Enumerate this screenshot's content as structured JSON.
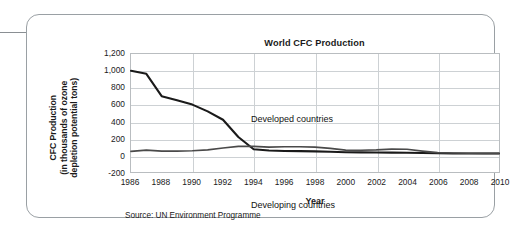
{
  "panel": {
    "connector": "leader-line"
  },
  "chart_data": {
    "type": "line",
    "title": "World CFC Production",
    "xlabel": "Year",
    "ylabel": "CFC Production (in thousands of ozone depletion potential tons)",
    "ylabel_line1": "CFC Production",
    "ylabel_line2": "(in thousands of ozone",
    "ylabel_line3": "depletion potential tons)",
    "source": "Source: UN Environment Programme",
    "xlim": [
      1986,
      2010
    ],
    "ylim": [
      -200,
      1200
    ],
    "ytick_labels": [
      "1,200",
      "1,000",
      "800",
      "600",
      "400",
      "200",
      "0",
      "-200"
    ],
    "ytick_values": [
      1200,
      1000,
      800,
      600,
      400,
      200,
      0,
      -200
    ],
    "xtick_labels": [
      "1986",
      "1988",
      "1990",
      "1992",
      "1994",
      "1996",
      "1998",
      "2000",
      "2002",
      "2004",
      "2006",
      "2008",
      "2010"
    ],
    "xtick_values": [
      1986,
      1988,
      1990,
      1992,
      1994,
      1996,
      1998,
      2000,
      2002,
      2004,
      2006,
      2008,
      2010
    ],
    "vgrid_values": [
      1990,
      1994,
      1998,
      2002,
      2006
    ],
    "grid": true,
    "legend": "inline-labels",
    "x": [
      1986,
      1987,
      1988,
      1989,
      1990,
      1991,
      1992,
      1993,
      1994,
      1995,
      1996,
      1997,
      1998,
      1999,
      2000,
      2001,
      2002,
      2003,
      2004,
      2005,
      2006,
      2007,
      2008,
      2009,
      2010
    ],
    "series": [
      {
        "name": "Developed countries",
        "color": "#1a1a1a",
        "values": [
          1000,
          965,
          700,
          650,
          600,
          520,
          420,
          215,
          70,
          55,
          50,
          48,
          45,
          40,
          35,
          33,
          32,
          30,
          28,
          25,
          22,
          20,
          20,
          20,
          20
        ]
      },
      {
        "name": "Developing countries",
        "color": "#4a4a4a",
        "values": [
          45,
          60,
          48,
          48,
          52,
          62,
          85,
          105,
          105,
          95,
          100,
          100,
          95,
          80,
          60,
          58,
          62,
          72,
          70,
          48,
          30,
          25,
          22,
          20,
          20
        ]
      }
    ],
    "annotations": [
      {
        "text": "Developed countries",
        "x": 1988,
        "y": 880
      },
      {
        "text": "Developing countries",
        "x": 1988,
        "y": -90
      }
    ]
  }
}
